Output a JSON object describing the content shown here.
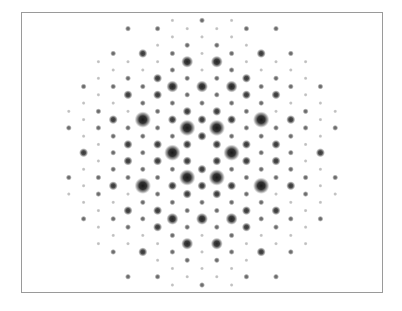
{
  "figure": {
    "title": "Diffraction pattern",
    "frame_color": "#9a9a9a",
    "background": "#ffffff",
    "spot_color": "#1a1a1a"
  },
  "lattice": {
    "center_x": 202,
    "center_y": 152.7,
    "step_x": 14.8,
    "step_y": 8.27,
    "symmetry": "mirror-x and mirror-y about center",
    "intensity_radius": [
      0,
      1.3,
      1.9,
      2.9,
      3.8,
      5.2
    ],
    "intensity_opacity": [
      0,
      0.28,
      0.65,
      0.85,
      0.92,
      0.97
    ],
    "upper_half_rows": [
      {
        "k": 0,
        "spots": {
          "0": 2,
          "2": 1
        }
      },
      {
        "k": 1,
        "spots": {
          "1": 1,
          "3": 2,
          "5": 2
        }
      },
      {
        "k": 2,
        "spots": {
          "0": 1,
          "2": 1
        }
      },
      {
        "k": 3,
        "spots": {
          "1": 2,
          "3": 1
        }
      },
      {
        "k": 4,
        "spots": {
          "0": 1,
          "2": 2,
          "4": 3,
          "6": 2
        }
      },
      {
        "k": 5,
        "spots": {
          "1": 4,
          "3": 1,
          "5": 1,
          "7": 1
        }
      },
      {
        "k": 6,
        "spots": {
          "0": 1,
          "2": 2,
          "4": 1,
          "6": 1
        }
      },
      {
        "k": 7,
        "spots": {
          "1": 2,
          "3": 3,
          "5": 2,
          "7": 1
        }
      },
      {
        "k": 8,
        "spots": {
          "0": 4,
          "2": 4,
          "4": 2,
          "6": 2,
          "8": 2
        }
      },
      {
        "k": 9,
        "spots": {
          "1": 2,
          "3": 3,
          "5": 3,
          "7": 1
        }
      },
      {
        "k": 10,
        "spots": {
          "0": 2,
          "2": 2,
          "4": 2,
          "6": 1,
          "8": 1
        }
      },
      {
        "k": 11,
        "spots": {
          "1": 3,
          "3": 2,
          "5": 1,
          "7": 2,
          "9": 1
        }
      },
      {
        "k": 12,
        "spots": {
          "0": 3,
          "2": 3,
          "4": 5,
          "6": 3,
          "8": 1
        }
      },
      {
        "k": 13,
        "spots": {
          "1": 5,
          "3": 2,
          "5": 2,
          "7": 2,
          "9": 2
        }
      },
      {
        "k": 14,
        "spots": {
          "0": 3,
          "2": 2,
          "4": 2,
          "6": 2,
          "8": 1
        }
      },
      {
        "k": 15,
        "spots": {
          "1": 3,
          "3": 3,
          "5": 3,
          "7": 1
        }
      },
      {
        "k": 16,
        "spots": {
          "2": 5,
          "4": 2,
          "6": 2,
          "8": 3
        }
      }
    ]
  }
}
